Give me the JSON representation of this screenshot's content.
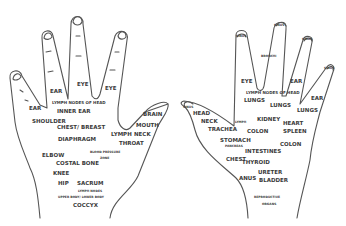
{
  "left_hand": {
    "labels": {
      "ear_finger": "EAR",
      "eye_middle": "EYE",
      "eye_index": "EYE",
      "ear_pinky": "EAR",
      "lymph_head": "LYMPH NODES OF HEAD",
      "inner_ear": "INNER EAR",
      "shoulder": "SHOULDER",
      "chest_breast": "CHEST/ BREAST",
      "diaphragm": "DIAPHRAGM",
      "brain": "BRAIN",
      "mouth": "MOUTH",
      "lymph": "LYMPH",
      "neck": "NECK",
      "throat": "THROAT",
      "blood_pressure_1": "BLOOD PRESSURE",
      "blood_pressure_2": "ZONE",
      "elbow": "ELBOW",
      "costal_bone": "COSTAL BONE",
      "knee": "KNEE",
      "hip": "HIP",
      "sacrum": "SACRUM",
      "lymph_nodes": "LYMPH NODES",
      "upper_lower_body": "UPPER BODY/ LOWER BODY",
      "coccyx": "COCCYX"
    }
  },
  "right_hand": {
    "labels": {
      "sinus_thumb": "SINUS",
      "sinus_1": "SINUS",
      "sinus_2": "SINUS",
      "sinus_3": "SINUS",
      "sinus_4": "SINUS",
      "bronchi": "BRONCHI",
      "eye": "EYE",
      "ear_1": "EAR",
      "ear_2": "EAR",
      "lymph_head": "LYMPH NODES OF HEAD",
      "lungs_1": "LUNGS",
      "lungs_2": "LUNGS",
      "lungs_3": "LUNGS",
      "head": "HEAD",
      "neck": "NECK",
      "trachea": "TRACHEA",
      "lymph": "LYMPH",
      "kidney": "KIDNEY",
      "heart": "HEART",
      "colon_1": "COLON",
      "spleen": "SPLEEN",
      "stomach": "STOMACH",
      "pancreas": "PANCREAS",
      "colon_2": "COLON",
      "intestines": "INTESTINES",
      "chest": "CHEST",
      "thyroid": "THYROID",
      "ureter": "URETER",
      "anus": "ANUS",
      "bladder": "BLADDER",
      "reproductive_1": "REPRODUCTIVE",
      "reproductive_2": "ORGANS"
    }
  }
}
